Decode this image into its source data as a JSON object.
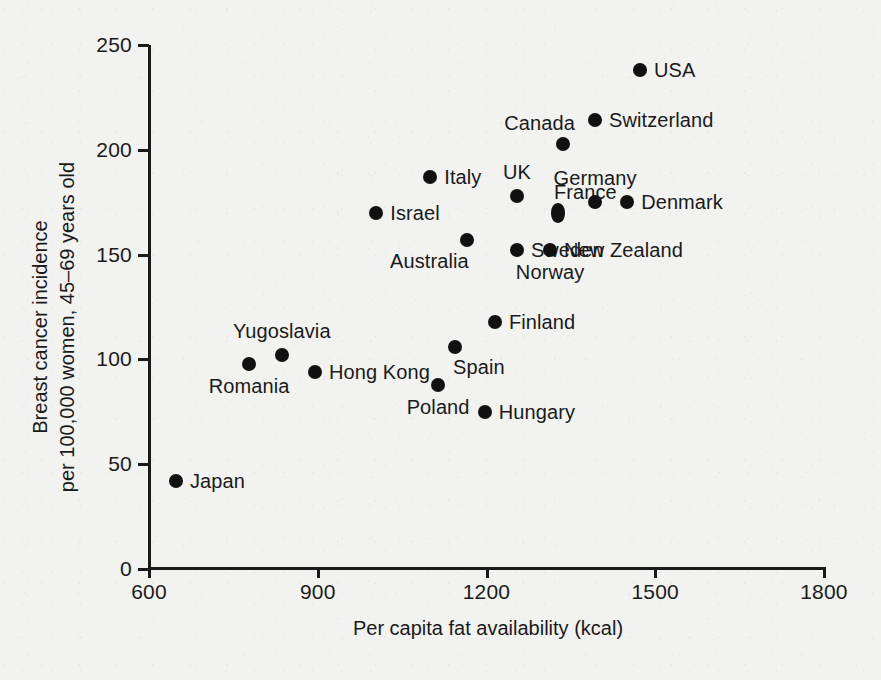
{
  "chart_data": {
    "type": "scatter",
    "title": "",
    "xlabel": "Per capita fat availability (kcal)",
    "ylabel_lines": [
      "Breast cancer incidence",
      "per 100,000 women, 45–69 years old"
    ],
    "ylabel": "Breast cancer incidence per 100,000 women, 45–69 years old",
    "xlim": [
      600,
      1800
    ],
    "ylim": [
      0,
      250
    ],
    "xticks": [
      600,
      900,
      1200,
      1500,
      1800
    ],
    "xtick_labels": [
      "600",
      "900",
      "1200",
      "1500",
      "1800"
    ],
    "yticks": [
      0,
      50,
      100,
      150,
      200,
      250
    ],
    "ytick_labels": [
      "0",
      "50",
      "100",
      "150",
      "200",
      "250"
    ],
    "grid": false,
    "legend": false,
    "marker": "filled-circle",
    "marker_color": "#111111",
    "points": [
      {
        "label": "Japan",
        "x": 648,
        "y": 42,
        "label_pos": "right"
      },
      {
        "label": "Romania",
        "x": 778,
        "y": 98,
        "label_pos": "below"
      },
      {
        "label": "Yugoslavia",
        "x": 836,
        "y": 102,
        "label_pos": "above"
      },
      {
        "label": "Hong Kong",
        "x": 895,
        "y": 94,
        "label_pos": "right"
      },
      {
        "label": "Israel",
        "x": 1004,
        "y": 170,
        "label_pos": "right"
      },
      {
        "label": "Italy",
        "x": 1100,
        "y": 187,
        "label_pos": "right"
      },
      {
        "label": "Poland",
        "x": 1114,
        "y": 88,
        "label_pos": "below"
      },
      {
        "label": "Spain",
        "x": 1144,
        "y": 106,
        "label_pos": "below-right"
      },
      {
        "label": "Australia",
        "x": 1165,
        "y": 157,
        "label_pos": "below-left"
      },
      {
        "label": "Hungary",
        "x": 1197,
        "y": 75,
        "label_pos": "right"
      },
      {
        "label": "Finland",
        "x": 1215,
        "y": 118,
        "label_pos": "right"
      },
      {
        "label": "UK",
        "x": 1254,
        "y": 178,
        "label_pos": "above"
      },
      {
        "label": "Sweden",
        "x": 1254,
        "y": 152,
        "label_pos": "right"
      },
      {
        "label": "France",
        "x": 1327,
        "y": 170,
        "label_pos": "above-right"
      },
      {
        "label": "New Zealand",
        "x": 1313,
        "y": 152,
        "label_pos": "right"
      },
      {
        "label": "Norway",
        "x": 1313,
        "y": 152,
        "label_pos": "below"
      },
      {
        "label": "Canada",
        "x": 1336,
        "y": 203,
        "label_pos": "above-left"
      },
      {
        "label": "Switzerland",
        "x": 1393,
        "y": 214,
        "label_pos": "right"
      },
      {
        "label": "Germany",
        "x": 1393,
        "y": 175,
        "label_pos": "above"
      },
      {
        "label": "Denmark",
        "x": 1450,
        "y": 175,
        "label_pos": "right"
      },
      {
        "label": "USA",
        "x": 1473,
        "y": 238,
        "label_pos": "right"
      }
    ]
  },
  "axes": {
    "x_title": "Per capita fat availability (kcal)",
    "y_title_line1": "Breast cancer incidence",
    "y_title_line2": "per 100,000 women, 45–69 years old"
  },
  "colors": {
    "background": "#f2f2f0",
    "ink": "#1a1a1a",
    "marker": "#111111"
  }
}
